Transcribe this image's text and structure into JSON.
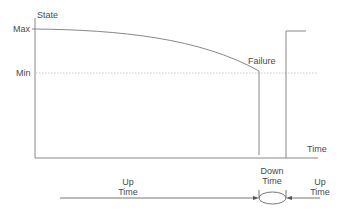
{
  "diagram": {
    "y_axis_label": "State",
    "x_axis_label": "Time",
    "levels": {
      "max": "Max",
      "min": "Min"
    },
    "event_label": "Failure",
    "intervals": [
      {
        "label_line1": "Up",
        "label_line2": "Time",
        "position": "before_failure"
      },
      {
        "label_line1": "Down",
        "label_line2": "Time",
        "position": "repair"
      },
      {
        "label_line1": "Up",
        "label_line2": "Time",
        "position": "after_repair"
      }
    ],
    "colors": {
      "line": "#888888",
      "dotted": "#bbbbbb",
      "text": "#4a4a4a"
    }
  }
}
